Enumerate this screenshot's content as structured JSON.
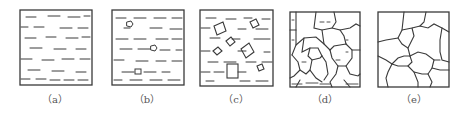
{
  "figure": {
    "stroke_color": "#3a3a3a",
    "panels": [
      {
        "id": "a",
        "label": "（a）",
        "center_x": 55
      },
      {
        "id": "b",
        "label": "（b）",
        "center_x": 147
      },
      {
        "id": "c",
        "label": "（c）",
        "center_x": 236
      },
      {
        "id": "d",
        "label": "（d）",
        "center_x": 325
      },
      {
        "id": "e",
        "label": "（e）",
        "center_x": 414
      }
    ]
  }
}
